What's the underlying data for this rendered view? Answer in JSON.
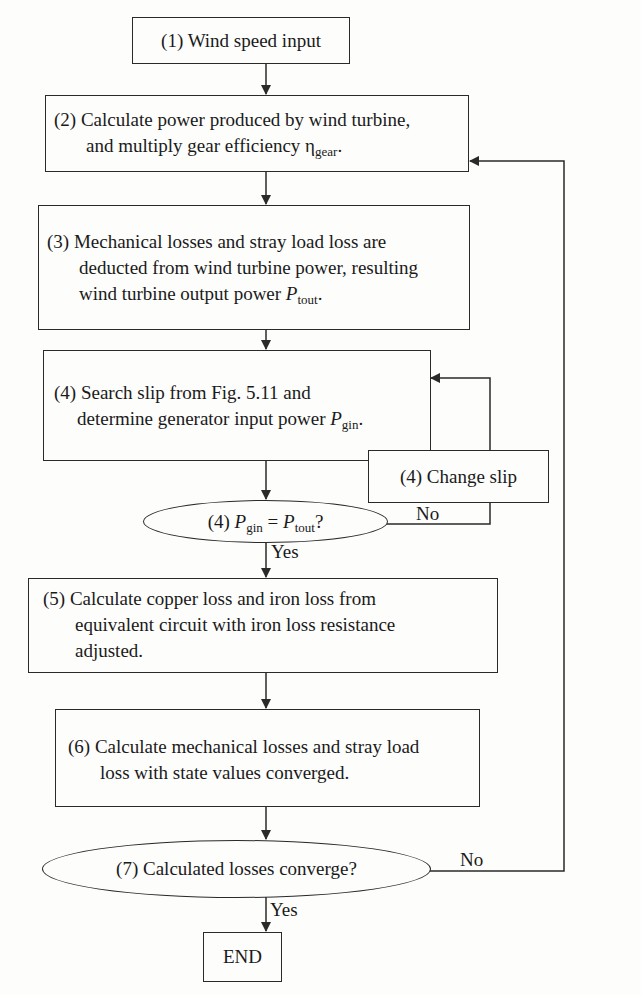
{
  "flowchart": {
    "title": "Loss calculation flowchart",
    "steps": {
      "s1": {
        "text": "(1) Wind speed input"
      },
      "s2": {
        "line1": "(2) Calculate power produced by wind turbine,",
        "line2_prefix": "and multiply gear efficiency η",
        "line2_sub": "gear",
        "line2_suffix": "."
      },
      "s3": {
        "line1": "(3) Mechanical losses and stray load loss are",
        "line2": "deducted from wind turbine power, resulting",
        "line3_prefix": "wind turbine output power ",
        "line3_var": "P",
        "line3_sub": "tout",
        "line3_suffix": "."
      },
      "s4": {
        "line1": "(4) Search slip from Fig. 5.11 and",
        "line2_prefix": "determine generator input power ",
        "line2_var": "P",
        "line2_sub": "gin",
        "line2_suffix": "."
      },
      "s4_change": {
        "text": "(4) Change slip"
      },
      "d4": {
        "prefix": "(4) ",
        "var1": "P",
        "sub1": "gin",
        "eq": " = ",
        "var2": "P",
        "sub2": "tout",
        "suffix": "?"
      },
      "s5": {
        "line1": "(5) Calculate copper loss and iron loss from",
        "line2": "equivalent circuit with iron loss resistance",
        "line3": "adjusted."
      },
      "s6": {
        "line1": "(6) Calculate mechanical losses and stray load",
        "line2": "loss with state values converged."
      },
      "d7": {
        "text": "(7) Calculated losses converge?"
      },
      "end": {
        "text": "END"
      }
    },
    "edge_labels": {
      "d4_no": "No",
      "d4_yes": "Yes",
      "d7_no": "No",
      "d7_yes": "Yes"
    },
    "colors": {
      "line": "#2a2a2a",
      "text": "#1a1a1a",
      "background": "#fdfdfc"
    }
  }
}
